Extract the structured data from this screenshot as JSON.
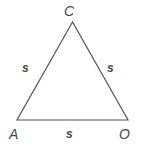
{
  "figure": {
    "type": "geometry-diagram",
    "shape": "equilateral-triangle",
    "background_color": "#ffffff",
    "stroke_color": "#555555",
    "stroke_width": 1.2,
    "text_color": "#4a4a4a",
    "vertices": [
      {
        "id": "C",
        "label": "C",
        "x": 72.5,
        "y": 22
      },
      {
        "id": "A",
        "label": "A",
        "x": 17,
        "y": 120
      },
      {
        "id": "O",
        "label": "O",
        "x": 128,
        "y": 120
      }
    ],
    "sides": [
      {
        "id": "AC",
        "label": "s",
        "from": "A",
        "to": "C"
      },
      {
        "id": "CO",
        "label": "s",
        "from": "C",
        "to": "O"
      },
      {
        "id": "AO",
        "label": "s",
        "from": "A",
        "to": "O"
      }
    ],
    "polygon_points": "72.5,22 17,120 128,120"
  }
}
